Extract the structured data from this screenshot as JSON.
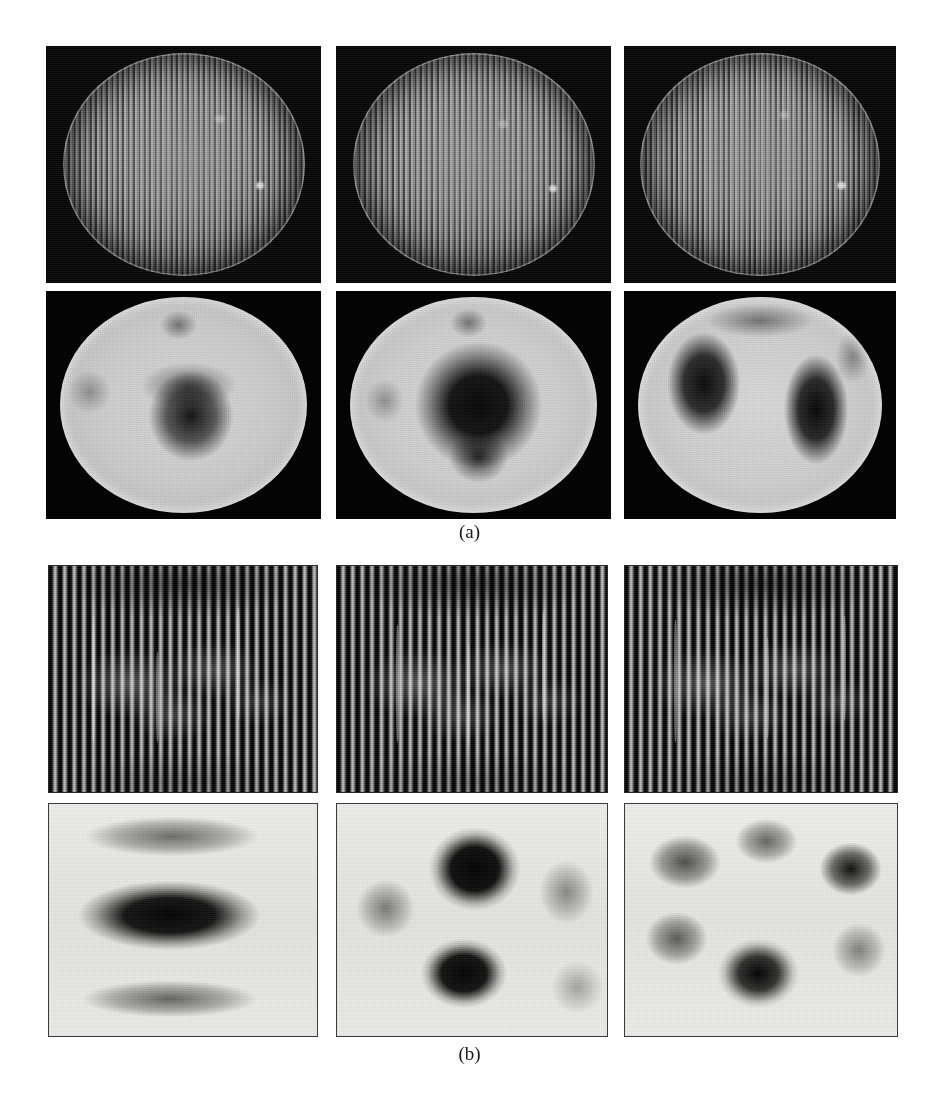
{
  "figure": {
    "type": "scientific-figure-panel-grid",
    "width": 939,
    "height": 1103,
    "background_color": "#ffffff"
  },
  "captions": [
    {
      "id": "caption-a",
      "label": "(a)",
      "x": 469,
      "y": 533
    },
    {
      "id": "caption-b",
      "label": "(b)",
      "x": 469,
      "y": 1053
    }
  ],
  "subfigures": [
    {
      "id": "subfigure-a",
      "label": "(a)",
      "description": "Elliptical specimen: carrier fringe patterns (top row) and corresponding wrapped phase / deformation maps (bottom row)",
      "rows": [
        {
          "id": "a-row-1",
          "kind": "fringe-pattern",
          "shape": "ellipse",
          "background_color": "#050505",
          "panels": [
            {
              "id": "a-r1-c1",
              "x": 46,
              "y": 46,
              "w": 275,
              "h": 237,
              "fringe_orientation": "vertical",
              "fringe_count": 62,
              "highlight_spots": 2
            },
            {
              "id": "a-r1-c2",
              "x": 336,
              "y": 46,
              "w": 275,
              "h": 237,
              "fringe_orientation": "vertical",
              "fringe_count": 60,
              "highlight_spots": 2
            },
            {
              "id": "a-r1-c3",
              "x": 624,
              "y": 46,
              "w": 272,
              "h": 237,
              "fringe_orientation": "vertical",
              "fringe_count": 64,
              "highlight_spots": 2
            }
          ]
        },
        {
          "id": "a-row-2",
          "kind": "phase-map",
          "shape": "ellipse",
          "background_color": "#040404",
          "panels": [
            {
              "id": "a-r2-c1",
              "x": 46,
              "y": 291,
              "w": 275,
              "h": 228,
              "pattern": "single central dark lobe with small upper satellite",
              "blobs": [
                {
                  "cx": 53,
                  "cy": 55,
                  "rx": 21,
                  "ry": 26,
                  "darkness": 0.92
                },
                {
                  "cx": 52,
                  "cy": 41,
                  "rx": 26,
                  "ry": 14,
                  "darkness": 0.55
                },
                {
                  "cx": 48,
                  "cy": 13,
                  "rx": 9,
                  "ry": 8,
                  "darkness": 0.45
                },
                {
                  "cx": 12,
                  "cy": 44,
                  "rx": 10,
                  "ry": 12,
                  "darkness": 0.3
                }
              ]
            },
            {
              "id": "a-r2-c2",
              "x": 336,
              "y": 291,
              "w": 275,
              "h": 228,
              "pattern": "large central ring-shaped dark lobe",
              "blobs": [
                {
                  "cx": 52,
                  "cy": 50,
                  "rx": 27,
                  "ry": 31,
                  "darkness": 0.97
                },
                {
                  "cx": 52,
                  "cy": 73,
                  "rx": 14,
                  "ry": 14,
                  "darkness": 0.75
                },
                {
                  "cx": 48,
                  "cy": 12,
                  "rx": 9,
                  "ry": 8,
                  "darkness": 0.45
                },
                {
                  "cx": 14,
                  "cy": 48,
                  "rx": 9,
                  "ry": 12,
                  "darkness": 0.3
                }
              ]
            },
            {
              "id": "a-r2-c3",
              "x": 624,
              "y": 291,
              "w": 272,
              "h": 228,
              "pattern": "two lateral dark lobes separated by a bright vertical band",
              "blobs": [
                {
                  "cx": 27,
                  "cy": 40,
                  "rx": 16,
                  "ry": 26,
                  "darkness": 0.95
                },
                {
                  "cx": 72,
                  "cy": 52,
                  "rx": 14,
                  "ry": 28,
                  "darkness": 0.97
                },
                {
                  "cx": 50,
                  "cy": 12,
                  "rx": 26,
                  "ry": 9,
                  "darkness": 0.45
                },
                {
                  "cx": 86,
                  "cy": 30,
                  "rx": 8,
                  "ry": 14,
                  "darkness": 0.35
                }
              ]
            }
          ]
        }
      ]
    },
    {
      "id": "subfigure-b",
      "label": "(b)",
      "description": "Rectangular specimen: high-contrast vertical carrier fringe patterns (top row) and corresponding phase / mode-shape maps (bottom row)",
      "rows": [
        {
          "id": "b-row-1",
          "kind": "fringe-pattern",
          "shape": "rectangle",
          "background_color": "#0a0a0a",
          "panels": [
            {
              "id": "b-r1-c1",
              "x": 48,
              "y": 565,
              "w": 268,
              "h": 226,
              "fringe_orientation": "vertical",
              "fringe_count": 30
            },
            {
              "id": "b-r1-c2",
              "x": 336,
              "y": 565,
              "w": 270,
              "h": 226,
              "fringe_orientation": "vertical",
              "fringe_count": 30
            },
            {
              "id": "b-r1-c3",
              "x": 624,
              "y": 565,
              "w": 272,
              "h": 226,
              "fringe_orientation": "vertical",
              "fringe_count": 30
            }
          ]
        },
        {
          "id": "b-row-2",
          "kind": "phase-map",
          "shape": "rectangle",
          "background_color": "#e8e8e6",
          "panels": [
            {
              "id": "b-r2-c1",
              "x": 48,
              "y": 803,
              "w": 268,
              "h": 232,
              "pattern": "three horizontal dark bands (1x3 mode)",
              "blobs": [
                {
                  "cx": 46,
                  "cy": 14,
                  "rx": 37,
                  "ry": 9,
                  "darkness": 0.55
                },
                {
                  "cx": 45,
                  "cy": 48,
                  "rx": 33,
                  "ry": 14,
                  "darkness": 1.0
                },
                {
                  "cx": 45,
                  "cy": 83,
                  "rx": 36,
                  "ry": 8,
                  "darkness": 0.58
                }
              ]
            },
            {
              "id": "b-r2-c2",
              "x": 336,
              "y": 803,
              "w": 270,
              "h": 232,
              "pattern": "two strong vertical-centre lobes plus weak side lobes",
              "blobs": [
                {
                  "cx": 51,
                  "cy": 28,
                  "rx": 16,
                  "ry": 17,
                  "darkness": 1.0
                },
                {
                  "cx": 47,
                  "cy": 72,
                  "rx": 15,
                  "ry": 14,
                  "darkness": 1.0
                },
                {
                  "cx": 18,
                  "cy": 45,
                  "rx": 11,
                  "ry": 13,
                  "darkness": 0.45
                },
                {
                  "cx": 84,
                  "cy": 38,
                  "rx": 10,
                  "ry": 14,
                  "darkness": 0.4
                },
                {
                  "cx": 88,
                  "cy": 78,
                  "rx": 10,
                  "ry": 12,
                  "darkness": 0.3
                }
              ]
            },
            {
              "id": "b-r2-c3",
              "x": 624,
              "y": 803,
              "w": 272,
              "h": 232,
              "pattern": "six discrete dark lobes arranged in a 3x2 grid",
              "blobs": [
                {
                  "cx": 22,
                  "cy": 25,
                  "rx": 14,
                  "ry": 12,
                  "darkness": 0.65
                },
                {
                  "cx": 52,
                  "cy": 17,
                  "rx": 12,
                  "ry": 10,
                  "darkness": 0.58
                },
                {
                  "cx": 82,
                  "cy": 28,
                  "rx": 12,
                  "ry": 12,
                  "darkness": 0.92
                },
                {
                  "cx": 19,
                  "cy": 58,
                  "rx": 12,
                  "ry": 12,
                  "darkness": 0.6
                },
                {
                  "cx": 49,
                  "cy": 72,
                  "rx": 14,
                  "ry": 14,
                  "darkness": 1.0
                },
                {
                  "cx": 85,
                  "cy": 62,
                  "rx": 10,
                  "ry": 12,
                  "darkness": 0.42
                }
              ]
            }
          ]
        }
      ]
    }
  ]
}
